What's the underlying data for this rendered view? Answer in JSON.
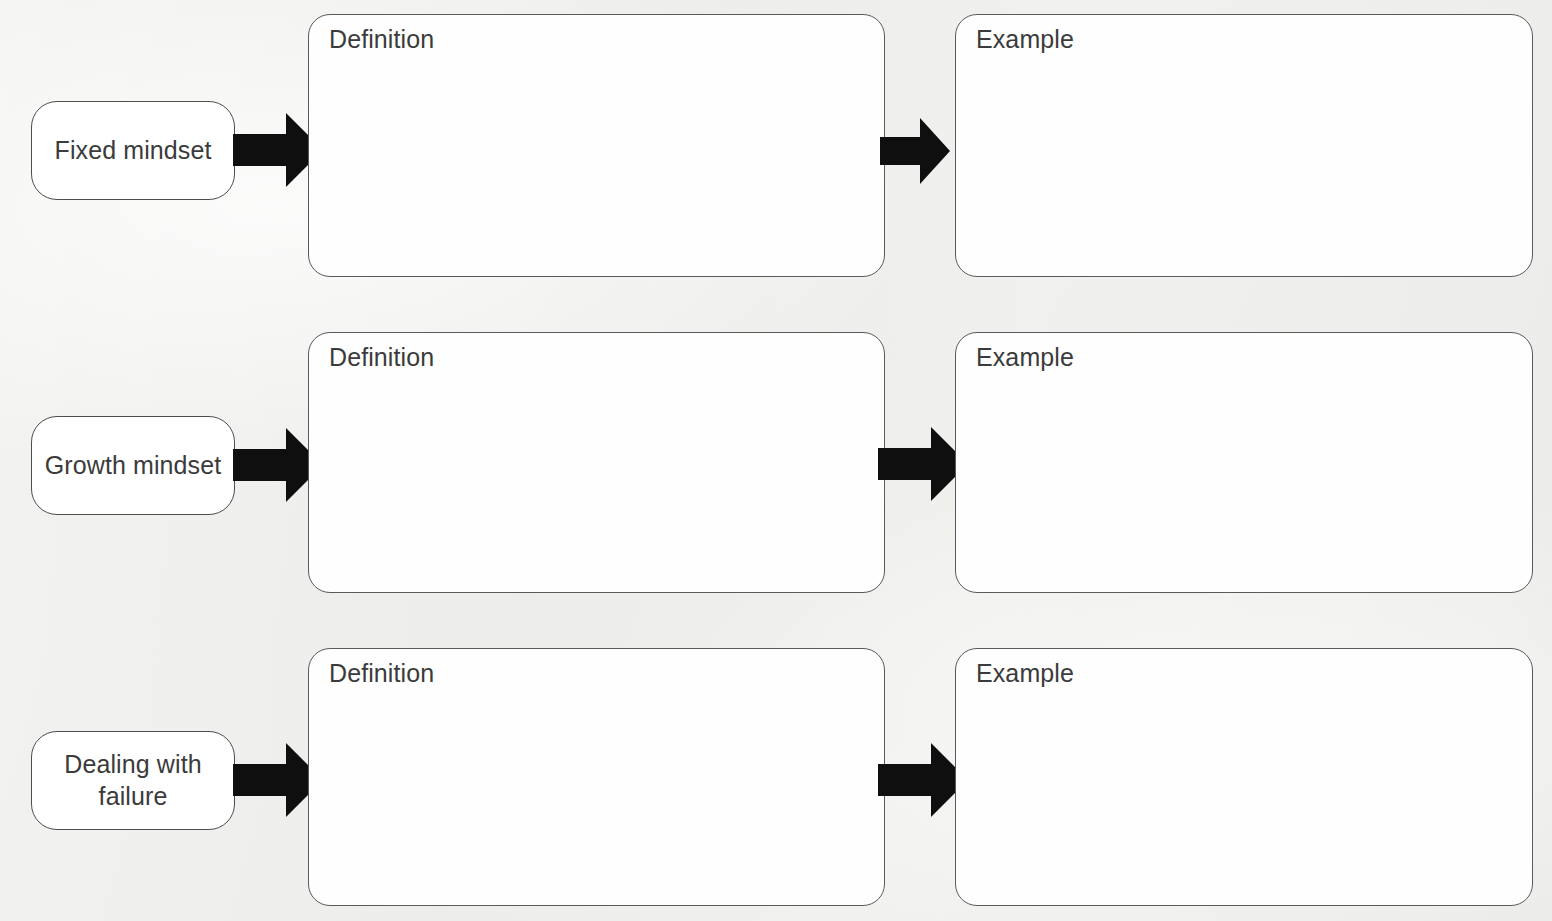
{
  "document": {
    "title": "Mindset graphic organizer worksheet",
    "background_color": "#efefed",
    "box_fill_color": "#fefefe",
    "box_border_color": "#5a5a5a",
    "arrow_color": "#100f0f",
    "text_color": "#3b3b3b"
  },
  "rows": [
    {
      "topic_label": "Fixed mindset",
      "definition_heading": "Definition",
      "definition_content": "",
      "example_heading": "Example",
      "example_content": "",
      "arrow1_name": "arrow-fixed-to-definition",
      "arrow2_name": "arrow-definition-to-example"
    },
    {
      "topic_label": "Growth mindset",
      "definition_heading": "Definition",
      "definition_content": "",
      "example_heading": "Example",
      "example_content": "",
      "arrow1_name": "arrow-growth-to-definition",
      "arrow2_name": "arrow-definition-to-example"
    },
    {
      "topic_label": "Dealing with failure",
      "definition_heading": "Definition",
      "definition_content": "",
      "example_heading": "Example",
      "example_content": "",
      "arrow1_name": "arrow-failure-to-definition",
      "arrow2_name": "arrow-definition-to-example"
    }
  ]
}
